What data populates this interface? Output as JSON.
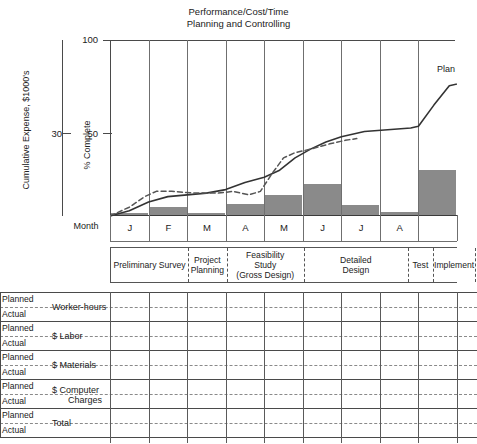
{
  "chart_data": {
    "type": "area",
    "title": "Performance/Cost/Time",
    "subtitle": "Planning and Controlling",
    "xlabel": "Month",
    "ylabel_left": "Cumulative Expense, $1000's",
    "ylabel_right": "% Complete",
    "left_axis": {
      "ticks": [
        30
      ],
      "tick_labels": [
        "30"
      ]
    },
    "right_axis": {
      "ticks": [
        50,
        100
      ],
      "tick_labels": [
        "50",
        "100"
      ],
      "ylim": [
        0,
        100
      ]
    },
    "categories": [
      "J",
      "F",
      "M",
      "A",
      "M",
      "J",
      "J",
      "A",
      ""
    ],
    "grid": "vertical",
    "legend_position": "inline-right",
    "series": [
      {
        "name": "Plan",
        "style": "solid",
        "label": "Plan",
        "arrowhead": true,
        "points": [
          [
            0.0,
            0
          ],
          [
            0.5,
            3
          ],
          [
            1.0,
            8
          ],
          [
            1.5,
            11
          ],
          [
            2.0,
            12
          ],
          [
            2.5,
            13
          ],
          [
            3.0,
            15
          ],
          [
            3.5,
            19
          ],
          [
            4.0,
            22
          ],
          [
            4.4,
            26
          ],
          [
            4.8,
            33
          ],
          [
            5.2,
            38
          ],
          [
            5.6,
            42
          ],
          [
            6.0,
            45
          ],
          [
            6.6,
            48
          ],
          [
            7.2,
            49
          ],
          [
            7.8,
            50
          ],
          [
            8.0,
            51
          ],
          [
            8.4,
            63
          ],
          [
            8.8,
            74
          ],
          [
            9.2,
            76
          ]
        ]
      },
      {
        "name": "Actual",
        "style": "dashed",
        "points": [
          [
            0.0,
            0
          ],
          [
            0.5,
            5
          ],
          [
            0.9,
            11
          ],
          [
            1.2,
            14
          ],
          [
            1.6,
            14
          ],
          [
            2.2,
            13
          ],
          [
            2.8,
            13
          ],
          [
            3.2,
            14
          ],
          [
            3.6,
            12
          ],
          [
            3.9,
            14
          ],
          [
            4.2,
            24
          ],
          [
            4.5,
            33
          ],
          [
            4.8,
            36
          ],
          [
            5.2,
            38
          ],
          [
            5.7,
            41
          ],
          [
            6.1,
            43
          ],
          [
            6.4,
            44
          ]
        ]
      }
    ],
    "bars": {
      "name": "Monthly Expense",
      "color": "#8a8a8a",
      "categories": [
        "J",
        "F",
        "M",
        "A",
        "M",
        "J",
        "J",
        "A",
        ""
      ],
      "values": [
        1.5,
        5,
        1.5,
        7,
        12,
        18,
        6,
        2,
        26
      ]
    },
    "phases": [
      {
        "label": "Preliminary Survey",
        "start": 0.0,
        "end": 2.0
      },
      {
        "label": "Project Planning",
        "start": 2.0,
        "end": 3.0
      },
      {
        "label": "Feasibility Study\n(Gross Design)",
        "line1": "Feasibility",
        "line2": "Study",
        "line3": "(Gross Design)",
        "start": 3.0,
        "end": 5.0
      },
      {
        "label": "Detailed Design",
        "line1": "Detailed",
        "line2": "Design",
        "start": 5.0,
        "end": 7.7
      },
      {
        "label": "Test",
        "start": 7.7,
        "end": 8.35
      },
      {
        "label": "Implement",
        "start": 8.35,
        "end": 9.45
      }
    ]
  },
  "table": {
    "row_sublabels": [
      "Planned",
      "Actual"
    ],
    "rows": [
      {
        "name": "Worker-hours"
      },
      {
        "name": "$ Labor"
      },
      {
        "name": "$ Materials"
      },
      {
        "name": "$ Computer Charges",
        "line1": "$ Computer",
        "line2": "Charges"
      },
      {
        "name": "Total"
      }
    ]
  },
  "colors": {
    "bar_fill": "#8a8a8a",
    "plan_line": "#333333",
    "actual_line": "#555555",
    "axis": "#4a4a4a",
    "grid": "#6f6f6f",
    "text": "#1a1a1a"
  }
}
